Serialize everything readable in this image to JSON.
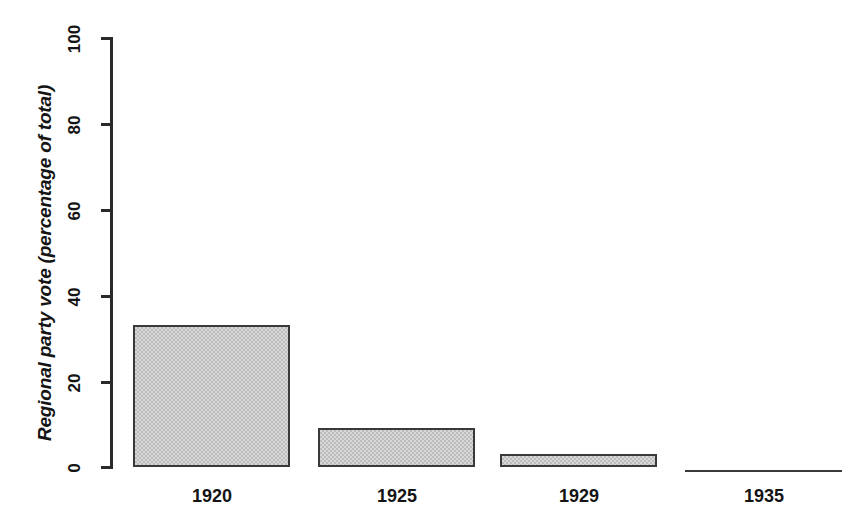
{
  "chart_data": {
    "type": "bar",
    "title": "",
    "subtitle": "",
    "xlabel": "",
    "ylabel": "Regional party vote (percentage of total)",
    "categories": [
      "1920",
      "1925",
      "1929",
      "1935"
    ],
    "values": [
      33,
      9,
      3,
      0
    ],
    "series": [
      {
        "name": "Regional party vote",
        "values": [
          33,
          9,
          3,
          0
        ]
      }
    ],
    "ylim": [
      0,
      100
    ],
    "yticks": [
      0,
      20,
      40,
      60,
      80,
      100
    ],
    "ytick_labels": [
      "0",
      "20",
      "40",
      "60",
      "80",
      "100"
    ],
    "grid": false,
    "legend": false,
    "legend_position": "none",
    "bar_fill_color": "#d9d9d9",
    "bar_edge_color": "#3a3a3a",
    "axis_color": "#2a2a2a",
    "background_color": "#ffffff",
    "annotations": []
  },
  "axis": {
    "y_title": "Regional party vote (percentage of total)",
    "ticks": [
      {
        "label": "100",
        "value": 100
      },
      {
        "label": "80",
        "value": 80
      },
      {
        "label": "60",
        "value": 60
      },
      {
        "label": "40",
        "value": 40
      },
      {
        "label": "20",
        "value": 20
      },
      {
        "label": "0",
        "value": 0
      }
    ]
  },
  "bars": [
    {
      "category": "1920",
      "value": 33,
      "value_label": ""
    },
    {
      "category": "1925",
      "value": 9,
      "value_label": ""
    },
    {
      "category": "1929",
      "value": 3,
      "value_label": ""
    },
    {
      "category": "1935",
      "value": 0,
      "value_label": ""
    }
  ]
}
